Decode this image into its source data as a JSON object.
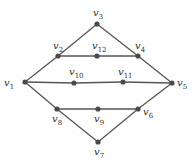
{
  "graph": {
    "colors": {
      "edge": "#555555",
      "node": "#4a4a4a",
      "label": "#333333",
      "background": "#ffffff"
    },
    "nodes": [
      {
        "id": "v1",
        "base": "v",
        "sub": "1",
        "x": 25,
        "y": 82,
        "lx": 4,
        "ly": 86
      },
      {
        "id": "v2",
        "base": "v",
        "sub": "2",
        "x": 58,
        "y": 56,
        "lx": 53,
        "ly": 49
      },
      {
        "id": "v3",
        "base": "v",
        "sub": "3",
        "x": 97,
        "y": 24,
        "lx": 93,
        "ly": 16
      },
      {
        "id": "v4",
        "base": "v",
        "sub": "4",
        "x": 138,
        "y": 56,
        "lx": 135,
        "ly": 49
      },
      {
        "id": "v5",
        "base": "v",
        "sub": "5",
        "x": 172,
        "y": 83,
        "lx": 177,
        "ly": 86
      },
      {
        "id": "v6",
        "base": "v",
        "sub": "6",
        "x": 138,
        "y": 109,
        "lx": 143,
        "ly": 115
      },
      {
        "id": "v7",
        "base": "v",
        "sub": "7",
        "x": 98,
        "y": 142,
        "lx": 94,
        "ly": 155
      },
      {
        "id": "v8",
        "base": "v",
        "sub": "8",
        "x": 57,
        "y": 109,
        "lx": 52,
        "ly": 122
      },
      {
        "id": "v9",
        "base": "v",
        "sub": "9",
        "x": 98,
        "y": 109,
        "lx": 94,
        "ly": 122
      },
      {
        "id": "v10",
        "base": "v",
        "sub": "10",
        "x": 74,
        "y": 83,
        "lx": 69,
        "ly": 75
      },
      {
        "id": "v11",
        "base": "v",
        "sub": "11",
        "x": 123,
        "y": 82,
        "lx": 118,
        "ly": 75
      },
      {
        "id": "v12",
        "base": "v",
        "sub": "12",
        "x": 97,
        "y": 56,
        "lx": 92,
        "ly": 49
      }
    ],
    "edges": [
      [
        "v1",
        "v2"
      ],
      [
        "v2",
        "v3"
      ],
      [
        "v3",
        "v4"
      ],
      [
        "v4",
        "v5"
      ],
      [
        "v1",
        "v8"
      ],
      [
        "v8",
        "v7"
      ],
      [
        "v7",
        "v6"
      ],
      [
        "v6",
        "v5"
      ],
      [
        "v2",
        "v12"
      ],
      [
        "v12",
        "v4"
      ],
      [
        "v1",
        "v10"
      ],
      [
        "v10",
        "v11"
      ],
      [
        "v11",
        "v5"
      ],
      [
        "v8",
        "v9"
      ],
      [
        "v9",
        "v6"
      ]
    ]
  }
}
